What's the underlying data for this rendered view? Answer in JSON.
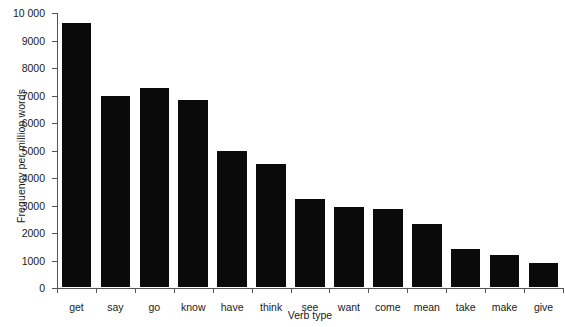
{
  "chart_data": {
    "type": "bar",
    "title": "",
    "xlabel": "Verb type",
    "ylabel": "Frequency per million words",
    "categories": [
      "get",
      "say",
      "go",
      "know",
      "have",
      "think",
      "see",
      "want",
      "come",
      "mean",
      "take",
      "make",
      "give"
    ],
    "values": [
      9600,
      6950,
      7250,
      6800,
      4950,
      4480,
      3200,
      2900,
      2850,
      2300,
      1400,
      1150,
      880
    ],
    "ylim": [
      0,
      10000
    ],
    "ytick_values": [
      0,
      1000,
      2000,
      3000,
      4000,
      5000,
      6000,
      7000,
      8000,
      9000,
      10000
    ],
    "ytick_labels": [
      "0",
      "1000",
      "2000",
      "3000",
      "4000",
      "5000",
      "6000",
      "7000",
      "8000",
      "9000",
      "10 000"
    ],
    "grid": false,
    "legend": null,
    "bar_color": "#0a0a0a",
    "axis_color": "#555555"
  }
}
